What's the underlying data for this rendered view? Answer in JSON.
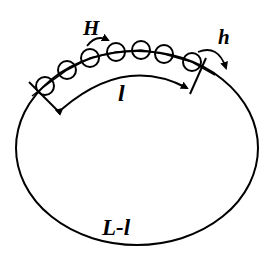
{
  "diagram": {
    "type": "ring-with-bead-chain",
    "labels": {
      "H": "H",
      "h": "h",
      "l": "l",
      "L_minus_l": "L-l"
    },
    "ring": {
      "cx": 137,
      "cy": 147,
      "rx": 121,
      "ry": 97,
      "stroke": "#000000"
    },
    "beads": [
      {
        "cx": 45,
        "cy": 86
      },
      {
        "cx": 67,
        "cy": 70
      },
      {
        "cx": 90,
        "cy": 58
      },
      {
        "cx": 116,
        "cy": 52
      },
      {
        "cx": 141,
        "cy": 50
      },
      {
        "cx": 164,
        "cy": 54
      },
      {
        "cx": 192,
        "cy": 62
      }
    ],
    "bead_radius": 9,
    "colors": {
      "stroke": "#000000",
      "background": "#ffffff"
    }
  }
}
